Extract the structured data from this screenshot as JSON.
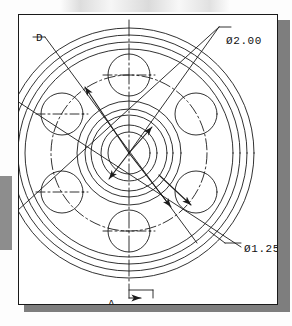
{
  "drawing": {
    "type": "mechanical-engineering-orthographic-view",
    "subject": "circular flange / pulley hub front view",
    "sheet": {
      "background_color": "#ffffff",
      "border_color": "#1a1a1a",
      "shadow_color": "#7e7e7e"
    },
    "labels": {
      "diameter_outer": "Ø2.00",
      "diameter_inner": "Ø1.25",
      "section_marker": "A",
      "clipped_left_label": "D"
    },
    "dimensions": [
      {
        "name": "outer-bore-diameter",
        "value": "Ø2.00",
        "symbol": "Ø",
        "number": "2.00"
      },
      {
        "name": "bolt-hole-diameter",
        "value": "Ø1.25",
        "symbol": "Ø",
        "number": "1.25"
      }
    ],
    "geometry": {
      "center": {
        "x": 110,
        "y": 138
      },
      "concentric_circles_radii": [
        125,
        118,
        111,
        104,
        52,
        44,
        38,
        28,
        21
      ],
      "bolt_circle_radius": 78,
      "bolt_hole_count": 6,
      "bolt_hole_radius": 21,
      "bolt_hole_angles_deg": [
        270,
        330,
        30,
        90,
        150,
        210
      ],
      "centerline_style": "dash-dot",
      "hidden_line_style": "dashed"
    },
    "line_color": "#1b1b1b",
    "section_arrow_direction": "right"
  }
}
